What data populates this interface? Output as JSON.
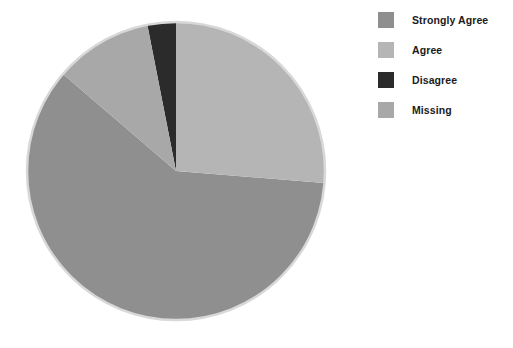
{
  "chart_data": {
    "type": "pie",
    "title": "",
    "subtitle": "",
    "xlabel": "",
    "ylabel": "",
    "grid": false,
    "legend_position": "right",
    "start_angle_deg": 0,
    "direction": "clockwise",
    "categories": [
      "Strongly Agree",
      "Agree",
      "Disagree",
      "Missing"
    ],
    "values": [
      60.0,
      26.3,
      3.1,
      10.6
    ],
    "value_unit": "percent",
    "colors": [
      "#8f8f8f",
      "#b5b5b5",
      "#2b2b2b",
      "#a8a8a8"
    ],
    "slices": [
      {
        "label": "Strongly Agree",
        "value": 60.0,
        "color": "#8f8f8f",
        "start_angle_deg": 94.6,
        "end_angle_deg": 310.6
      },
      {
        "label": "Agree",
        "value": 26.3,
        "color": "#b5b5b5",
        "start_angle_deg": 0,
        "end_angle_deg": 94.6
      },
      {
        "label": "Disagree",
        "value": 3.1,
        "color": "#2b2b2b",
        "start_angle_deg": 348.9,
        "end_angle_deg": 360
      },
      {
        "label": "Missing",
        "value": 10.6,
        "color": "#a8a8a8",
        "start_angle_deg": 310.6,
        "end_angle_deg": 348.9
      }
    ],
    "geometry": {
      "center_x": 176,
      "center_y": 171,
      "radius": 149,
      "outline_color": "#d8d8d8"
    }
  },
  "legend": {
    "items": [
      {
        "label": "Strongly Agree",
        "color": "#8f8f8f",
        "swatch_name": "legend-swatch-strongly-agree"
      },
      {
        "label": "Agree",
        "color": "#b5b5b5",
        "swatch_name": "legend-swatch-agree"
      },
      {
        "label": "Disagree",
        "color": "#2b2b2b",
        "swatch_name": "legend-swatch-disagree"
      },
      {
        "label": "Missing",
        "color": "#a8a8a8",
        "swatch_name": "legend-swatch-missing"
      }
    ]
  },
  "background": {
    "color": "#ffffff"
  }
}
